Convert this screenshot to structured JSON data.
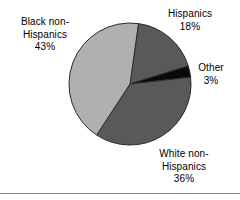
{
  "chart_data": {
    "type": "pie",
    "title": "",
    "subtitle": "",
    "xlabel": "",
    "ylabel": "",
    "legend_position": "none",
    "grid": false,
    "labels_inline": true,
    "categories": [
      "Hispanics",
      "Other",
      "White non-Hispanics",
      "Black non-Hispanics"
    ],
    "values": [
      18,
      3,
      36,
      43
    ],
    "value_suffix": "%",
    "colors": [
      "#595959",
      "#0a0a0a",
      "#595959",
      "#b0b0b0"
    ],
    "slices": [
      {
        "name": "Hispanics",
        "label_line1": "Hispanics",
        "label_line2": "",
        "percent_text": "18%",
        "value": 18,
        "color": "#595959",
        "start_angle_deg": 8,
        "end_angle_deg": 72.8
      },
      {
        "name": "Other",
        "label_line1": "Other",
        "label_line2": "",
        "percent_text": "3%",
        "value": 3,
        "color": "#0a0a0a",
        "start_angle_deg": 72.8,
        "end_angle_deg": 83.6
      },
      {
        "name": "White non-Hispanics",
        "label_line1": "White non-",
        "label_line2": "Hispanics",
        "percent_text": "36%",
        "value": 36,
        "color": "#595959",
        "start_angle_deg": 83.6,
        "end_angle_deg": 213.2
      },
      {
        "name": "Black non-Hispanics",
        "label_line1": "Black non-",
        "label_line2": "Hispanics",
        "percent_text": "43%",
        "value": 43,
        "color": "#b0b0b0",
        "start_angle_deg": 213.2,
        "end_angle_deg": 368
      }
    ]
  },
  "labels": {
    "black": {
      "line1": "Black non-",
      "line2": "Hispanics",
      "percent": "43%"
    },
    "hispanics": {
      "line1": "Hispanics",
      "percent": "18%"
    },
    "other": {
      "line1": "Other",
      "percent": "3%"
    },
    "white": {
      "line1": "White non-",
      "line2": "Hispanics",
      "percent": "36%"
    }
  },
  "style": {
    "background": "#ffffff",
    "text_color": "#000000",
    "rule_color": "#8a8a8a",
    "slice_light_gray": "#b0b0b0",
    "slice_dark_gray": "#595959",
    "slice_black": "#0a0a0a",
    "slice_outline": "#2b2b2b"
  }
}
